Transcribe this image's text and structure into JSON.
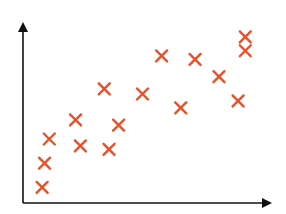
{
  "chart_data": {
    "type": "scatter",
    "title": "",
    "xlabel": "",
    "ylabel": "",
    "grid": false,
    "legend": null,
    "marker": "x",
    "marker_color": "#E8502A",
    "axis_color": "#111111",
    "axes_style": "arrows-no-ticks",
    "xlim": [
      0,
      10
    ],
    "ylim": [
      0,
      10
    ],
    "points": [
      {
        "x": 0.8,
        "y": 0.9
      },
      {
        "x": 0.9,
        "y": 2.3
      },
      {
        "x": 1.1,
        "y": 3.7
      },
      {
        "x": 2.2,
        "y": 4.8
      },
      {
        "x": 2.4,
        "y": 3.3
      },
      {
        "x": 3.4,
        "y": 6.6
      },
      {
        "x": 3.6,
        "y": 3.1
      },
      {
        "x": 4.0,
        "y": 4.5
      },
      {
        "x": 5.0,
        "y": 6.3
      },
      {
        "x": 5.8,
        "y": 8.5
      },
      {
        "x": 6.6,
        "y": 5.5
      },
      {
        "x": 7.2,
        "y": 8.3
      },
      {
        "x": 8.2,
        "y": 7.3
      },
      {
        "x": 9.0,
        "y": 5.9
      },
      {
        "x": 9.3,
        "y": 8.8
      },
      {
        "x": 9.3,
        "y": 9.6
      }
    ]
  },
  "plot_area": {
    "x0": 23,
    "y0": 203,
    "x1": 262,
    "y1": 30
  }
}
